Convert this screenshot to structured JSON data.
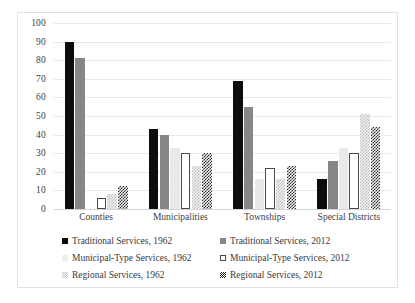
{
  "chart_data": {
    "type": "bar",
    "title": "",
    "xlabel": "",
    "ylabel": "",
    "ylim": [
      0,
      100
    ],
    "ytick_step": 10,
    "yticks": [
      100,
      90,
      80,
      70,
      60,
      50,
      40,
      30,
      20,
      10,
      0
    ],
    "grid": true,
    "legend_position": "bottom",
    "categories": [
      "Counties",
      "Municipalities",
      "Townships",
      "Special Districts"
    ],
    "series": [
      {
        "name": "Traditional Services, 1962",
        "color": "#0d0d0d",
        "pattern": "solid",
        "values": [
          90,
          43,
          69,
          16
        ]
      },
      {
        "name": "Traditional Services, 2012",
        "color": "#868686",
        "pattern": "solid",
        "values": [
          81,
          40,
          55,
          26
        ]
      },
      {
        "name": "Municipal-Type Services, 1962",
        "color": "#e9e9e9",
        "pattern": "solid-light",
        "values": [
          0,
          33,
          16,
          33
        ]
      },
      {
        "name": "Municipal-Type Services, 2012",
        "color": "#ffffff",
        "pattern": "outline",
        "values": [
          6,
          30,
          22,
          30
        ]
      },
      {
        "name": "Regional Services, 1962",
        "color": "#bdbdbd",
        "pattern": "light-checker",
        "values": [
          8,
          23,
          16,
          51
        ]
      },
      {
        "name": "Regional Services, 2012",
        "color": "#2b2b2b",
        "pattern": "dark-checker",
        "values": [
          12.5,
          30,
          23,
          44
        ]
      }
    ],
    "legend_order": [
      0,
      1,
      2,
      3,
      4,
      5
    ]
  }
}
